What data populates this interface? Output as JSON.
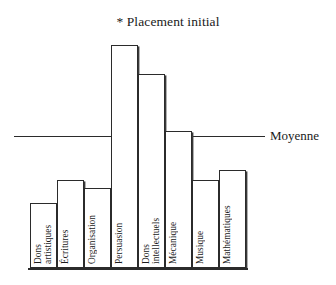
{
  "chart_data": {
    "type": "bar",
    "title": "* Placement initial",
    "xlabel": "",
    "ylabel": "",
    "categories": [
      "Dons artistiques",
      "Écritures",
      "Organisation",
      "Persuasion",
      "Dons intellectuels",
      "Mécanique",
      "Musique",
      "Mathématiques"
    ],
    "values": [
      26,
      41,
      36,
      132,
      113,
      75,
      41,
      47
    ],
    "ylim": [
      0,
      142
    ],
    "grid": false,
    "legend": null,
    "annotations": [
      {
        "name": "moyenne",
        "label": "Moyenne",
        "type": "horizontal-reference-line",
        "value": 72
      }
    ],
    "bars": [
      {
        "label": "Dons artistiques",
        "label_lines": "Dons\nartistiques",
        "value": 26,
        "top_px": 203,
        "x_px": 30,
        "width_px": 27
      },
      {
        "label": "Écritures",
        "label_lines": "Écritures",
        "value": 41,
        "top_px": 180,
        "x_px": 57,
        "width_px": 27
      },
      {
        "label": "Organisation",
        "label_lines": "Organisation",
        "value": 36,
        "top_px": 188,
        "x_px": 84,
        "width_px": 27
      },
      {
        "label": "Persuasion",
        "label_lines": "Persuasion",
        "value": 132,
        "top_px": 45,
        "x_px": 111,
        "width_px": 27
      },
      {
        "label": "Dons intellectuels",
        "label_lines": "Dons intellectuels",
        "value": 113,
        "top_px": 74,
        "x_px": 138,
        "width_px": 27
      },
      {
        "label": "Mécanique",
        "label_lines": "Mécanique",
        "value": 75,
        "top_px": 131,
        "x_px": 165,
        "width_px": 27
      },
      {
        "label": "Musique",
        "label_lines": "Musique",
        "value": 41,
        "top_px": 180,
        "x_px": 192,
        "width_px": 27
      },
      {
        "label": "Mathématiques",
        "label_lines": "Mathématiques",
        "value": 47,
        "top_px": 170,
        "x_px": 219,
        "width_px": 27
      }
    ],
    "colors": {
      "bar_stroke": "#2b2b2b",
      "bar_fill": "#ffffff",
      "mean_line": "#2b2b2b",
      "text": "#1a1a1a",
      "background": "#ffffff"
    }
  },
  "layout": {
    "baseline_y_px": 268,
    "mean_line_y_px": 136,
    "mean_line_x_start_px": 14,
    "mean_line_x_end_px": 265,
    "mean_label_x_px": 270,
    "mean_label_y_px": 129,
    "plot_left_px": 30,
    "plot_right_px": 246
  }
}
